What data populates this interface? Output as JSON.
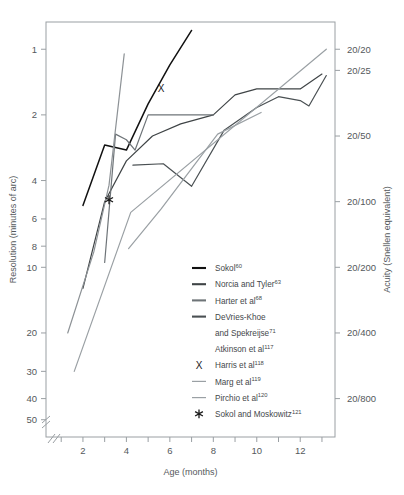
{
  "chart_data": {
    "type": "line",
    "title": "",
    "xlabel": "Age (months)",
    "ylabel": "Resolution (minutes of arc)",
    "ylabel_right": "Acuity (Snellen equivalent)",
    "xlim": [
      0.3,
      13.6
    ],
    "ylim_minutes_of_arc": [
      0.75,
      60
    ],
    "y_axis_scale": "log-reversed",
    "y_axis_break": true,
    "x_axis_break": true,
    "grid": false,
    "legend_position": "inside-lower-center",
    "xticks": [
      1,
      2,
      3,
      4,
      5,
      6,
      7,
      8,
      9,
      10,
      11,
      12,
      13
    ],
    "xtick_labels": [
      "",
      "2",
      "",
      "4",
      "",
      "6",
      "",
      "8",
      "",
      "10",
      "",
      "12",
      ""
    ],
    "yticks_left": [
      1,
      2,
      4,
      6,
      8,
      10,
      20,
      30,
      40,
      50
    ],
    "ytick_labels_left": [
      "1",
      "2",
      "4",
      "6",
      "8",
      "10",
      "20",
      "30",
      "40",
      "50"
    ],
    "yticks_right_values": [
      1,
      1.25,
      2.5,
      5,
      10,
      20,
      40
    ],
    "ytick_labels_right": [
      "20/20",
      "20/25",
      "20/50",
      "20/100",
      "20/200",
      "20/400",
      "20/800"
    ],
    "series": [
      {
        "name": "Sokol",
        "ref": "60",
        "color": "#111111",
        "width": 1.5,
        "marker": "none",
        "points": [
          [
            2.0,
            5.2
          ],
          [
            3.0,
            2.75
          ],
          [
            4.0,
            2.9
          ],
          [
            5.0,
            1.78
          ],
          [
            6.0,
            1.18
          ],
          [
            7.0,
            0.82
          ]
        ]
      },
      {
        "name": "Norcia and Tyler",
        "ref": "63",
        "color": "#3f4446",
        "width": 1.2,
        "marker": "none",
        "points": [
          [
            2.0,
            12.5
          ],
          [
            3.0,
            5.0
          ],
          [
            4.0,
            3.25
          ],
          [
            5.2,
            2.5
          ],
          [
            6.5,
            2.2
          ],
          [
            8.0,
            2.0
          ],
          [
            9.0,
            1.62
          ],
          [
            10.0,
            1.52
          ],
          [
            12.0,
            1.52
          ],
          [
            13.0,
            1.3
          ]
        ]
      },
      {
        "name": "Harter et al",
        "ref": "68",
        "color": "#6e7478",
        "width": 1.2,
        "marker": "none",
        "points": [
          [
            3.0,
            9.5
          ],
          [
            3.5,
            2.45
          ],
          [
            4.0,
            2.6
          ],
          [
            4.4,
            2.9
          ],
          [
            5.0,
            2.0
          ],
          [
            8.0,
            2.0
          ]
        ]
      },
      {
        "name": "DeVries-Khoe and Spekreijse",
        "ref": "71",
        "color": "#4a5053",
        "width": 1.2,
        "marker": "none",
        "points": [
          [
            4.3,
            3.4
          ],
          [
            5.7,
            3.35
          ],
          [
            7.0,
            4.25
          ],
          [
            8.5,
            2.35
          ],
          [
            10.0,
            1.85
          ],
          [
            11.0,
            1.65
          ],
          [
            12.0,
            1.72
          ],
          [
            12.4,
            1.82
          ],
          [
            13.2,
            1.32
          ]
        ]
      },
      {
        "name": "Atkinson et al",
        "ref": "117",
        "color": "#8d9296",
        "width": 1.2,
        "marker": "none",
        "points": [
          [
            1.3,
            20.0
          ],
          [
            2.5,
            8.5
          ],
          [
            3.2,
            4.2
          ],
          [
            3.9,
            1.05
          ]
        ]
      },
      {
        "name": "Harris et al",
        "ref": "118",
        "color": "#1b1b1b",
        "width": 0,
        "marker": "X",
        "points": [
          [
            5.6,
            1.52
          ]
        ]
      },
      {
        "name": "Marg et al",
        "ref": "119",
        "color": "#9aa0a4",
        "width": 1.2,
        "marker": "none",
        "points": [
          [
            1.6,
            30.0
          ],
          [
            4.2,
            5.6
          ],
          [
            13.2,
            1.0
          ]
        ]
      },
      {
        "name": "Pirchio et al",
        "ref": "120",
        "color": "#9aa0a4",
        "width": 1.2,
        "marker": "none",
        "points": [
          [
            4.1,
            8.2
          ],
          [
            5.6,
            5.4
          ],
          [
            8.2,
            2.45
          ],
          [
            10.2,
            1.95
          ]
        ]
      },
      {
        "name": "Sokol and Moskowitz",
        "ref": "121",
        "color": "#1b1b1b",
        "width": 0,
        "marker": "asterisk",
        "points": [
          [
            3.2,
            4.9
          ]
        ]
      }
    ]
  },
  "legend": {
    "items": [
      {
        "label": "Sokol",
        "ref": "60",
        "swatch": "line",
        "color": "#111111",
        "thick": true
      },
      {
        "label": "Norcia and Tyler",
        "ref": "63",
        "swatch": "line",
        "color": "#3f4446",
        "thick": true
      },
      {
        "label": "Harter et al",
        "ref": "68",
        "swatch": "line",
        "color": "#6e7478",
        "thick": true
      },
      {
        "label": "DeVries-Khoe",
        "label2": "and Spekreijse",
        "ref": "71",
        "swatch": "line",
        "color": "#4a5053",
        "thick": true
      },
      {
        "label": "Atkinson et al",
        "ref": "117",
        "swatch": "none",
        "color": "#8d9296",
        "thick": false
      },
      {
        "label": "Harris et al",
        "ref": "118",
        "swatch": "X",
        "color": "#1b1b1b",
        "thick": false
      },
      {
        "label": "Marg et al",
        "ref": "119",
        "swatch": "line",
        "color": "#9aa0a4",
        "thick": false
      },
      {
        "label": "Pirchio et al",
        "ref": "120",
        "swatch": "line",
        "color": "#9aa0a4",
        "thick": false
      },
      {
        "label": "Sokol and Moskowitz",
        "ref": "121",
        "swatch": "asterisk",
        "color": "#1b1b1b",
        "thick": false
      }
    ]
  },
  "axes": {
    "left_title": "Resolution (minutes of arc)",
    "right_title": "Acuity (Snellen equivalent)",
    "bottom_title": "Age (months)"
  },
  "colors": {
    "frame": "#9a9fa3",
    "text": "#55595c",
    "background": "#ffffff"
  }
}
